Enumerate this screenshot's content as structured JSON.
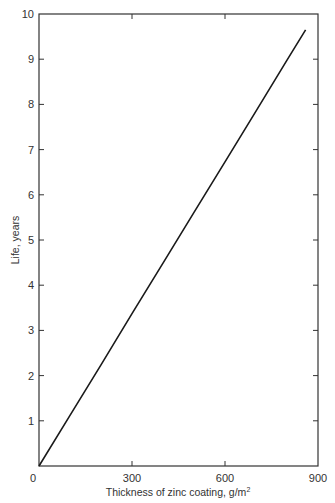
{
  "chart_data": {
    "type": "line",
    "title": "",
    "xlabel": "Thickness of zinc coating, g/m²",
    "ylabel": "Life, years",
    "xlim": [
      0,
      900
    ],
    "ylim": [
      0,
      10
    ],
    "x_ticks": [
      0,
      300,
      600,
      900
    ],
    "y_ticks": [
      0,
      1,
      2,
      3,
      4,
      5,
      6,
      7,
      8,
      9,
      10
    ],
    "grid": false,
    "legend": null,
    "series": [
      {
        "name": "Life vs zinc coating thickness",
        "x": [
          0,
          100,
          200,
          300,
          400,
          500,
          600,
          700,
          800,
          860
        ],
        "y": [
          0,
          1.12,
          2.24,
          3.37,
          4.49,
          5.61,
          6.73,
          7.85,
          8.98,
          9.65
        ]
      }
    ]
  },
  "labels": {
    "xlabel_main": "Thickness of zinc coating, g/m",
    "xlabel_sup": "2",
    "ylabel": "Life, years"
  }
}
